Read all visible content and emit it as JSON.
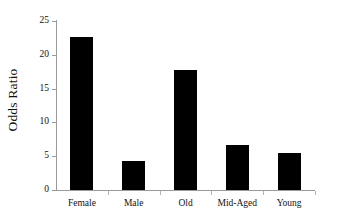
{
  "chart_data": {
    "type": "bar",
    "title": "",
    "subtitle": "",
    "xlabel": "",
    "ylabel": "Odds Ratio",
    "categories": [
      "Female",
      "Male",
      "Old",
      "Mid-Aged",
      "Young"
    ],
    "values": [
      22.7,
      4.3,
      17.8,
      6.7,
      5.5
    ],
    "ylim": [
      0,
      25
    ],
    "yticks": [
      0,
      5,
      10,
      15,
      20,
      25
    ],
    "ytick_labels": [
      "0",
      "5",
      "10",
      "15",
      "20",
      "25"
    ],
    "grid": false,
    "legend": false,
    "legend_position": "none",
    "bar_color": "#000000",
    "axis_color": "#9a9a9a",
    "background_color": "#ffffff"
  }
}
